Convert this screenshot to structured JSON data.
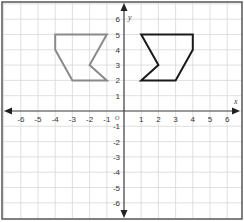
{
  "graph": {
    "x_axis_label": "x",
    "y_axis_label": "y",
    "origin_label": "O",
    "x_range": [
      -6,
      6
    ],
    "y_range": [
      -6,
      6
    ],
    "x_ticks": [
      "-6",
      "-5",
      "-4",
      "-3",
      "-2",
      "-1",
      "1",
      "2",
      "3",
      "4",
      "5",
      "6"
    ],
    "y_ticks": [
      "6",
      "5",
      "4",
      "3",
      "2",
      "1",
      "-1",
      "-2",
      "-3",
      "-4",
      "-5",
      "-6"
    ],
    "colors": {
      "grid": "#d8d8d8",
      "axis": "#444444",
      "border": "#555555",
      "shape_original": "#8a8a8a",
      "shape_image": "#1a1a1a"
    }
  },
  "shapes": [
    {
      "name": "original-figure",
      "color": "#8a8a8a",
      "vertices": [
        [
          -4,
          5
        ],
        [
          -1,
          5
        ],
        [
          -2,
          3
        ],
        [
          -1,
          2
        ],
        [
          -3,
          2
        ],
        [
          -4,
          4
        ]
      ]
    },
    {
      "name": "reflected-figure",
      "color": "#1a1a1a",
      "vertices": [
        [
          1,
          5
        ],
        [
          4,
          5
        ],
        [
          4,
          4
        ],
        [
          3,
          2
        ],
        [
          1,
          2
        ],
        [
          2,
          3
        ]
      ]
    }
  ]
}
